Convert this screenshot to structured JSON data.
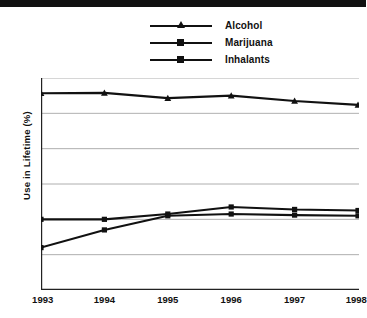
{
  "chart_data": {
    "type": "line",
    "title": "",
    "subtitle": "",
    "xlabel": "",
    "ylabel": "Use in Lifetime (%)",
    "categories": [
      "1993",
      "1994",
      "1995",
      "1996",
      "1997",
      "1998"
    ],
    "x": [
      1993,
      1994,
      1995,
      1996,
      1997,
      1998
    ],
    "xlim": [
      1993,
      1998
    ],
    "ylim": [
      0,
      60
    ],
    "yticks": [
      0,
      10,
      20,
      30,
      40,
      50,
      60
    ],
    "ytick_labels": [
      "0",
      "10",
      "20",
      "30",
      "40",
      "50",
      "60"
    ],
    "grid": "horizontal",
    "legend_position": "top-center",
    "series": [
      {
        "name": "Alcohol",
        "marker": "triangle",
        "color": "#111111",
        "values": [
          55.7,
          55.8,
          54.3,
          55.0,
          53.5,
          52.4
        ]
      },
      {
        "name": "Marijuana",
        "marker": "square",
        "color": "#111111",
        "values": [
          20.0,
          20.0,
          21.5,
          23.5,
          22.8,
          22.5
        ]
      },
      {
        "name": "Inhalants",
        "marker": "square",
        "color": "#111111",
        "values": [
          12.0,
          17.0,
          21.0,
          21.5,
          21.2,
          21.0
        ]
      }
    ]
  },
  "legend": {
    "items": [
      {
        "label": "Alcohol"
      },
      {
        "label": "Marijuana"
      },
      {
        "label": "Inhalants"
      }
    ]
  },
  "axes": {
    "y_title": "Use in Lifetime (%)"
  }
}
